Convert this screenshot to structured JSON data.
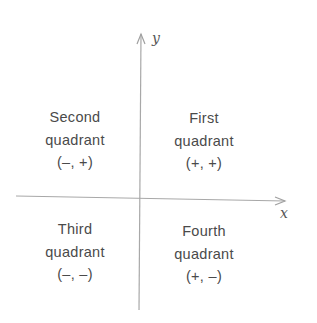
{
  "diagram": {
    "type": "coordinate-plane-quadrants",
    "axes": {
      "x_label": "x",
      "y_label": "y",
      "color": "#9a9a9a"
    },
    "text_color": "#4a4a4a",
    "quadrants": [
      {
        "name": "Second",
        "line1": "Second",
        "line2": "quadrant",
        "signs": "(–, +)"
      },
      {
        "name": "First",
        "line1": "First",
        "line2": "quadrant",
        "signs": "(+, +)"
      },
      {
        "name": "Third",
        "line1": "Third",
        "line2": "quadrant",
        "signs": "(–, –)"
      },
      {
        "name": "Fourth",
        "line1": "Fourth",
        "line2": "quadrant",
        "signs": "(+, –)"
      }
    ]
  }
}
